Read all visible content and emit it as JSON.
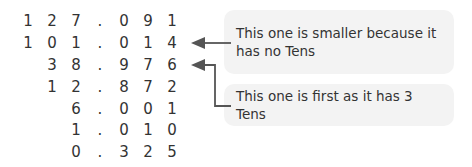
{
  "rows": [
    {
      "digits": [
        "1",
        "2",
        "7",
        ".",
        "0",
        "9",
        "1"
      ],
      "value": "127.091"
    },
    {
      "digits": [
        "1",
        "0",
        "1",
        ".",
        "0",
        "1",
        "4"
      ],
      "value": "101.014"
    },
    {
      "digits": [
        "",
        "3",
        "8",
        ".",
        "9",
        "7",
        "6"
      ],
      "value": "38.976"
    },
    {
      "digits": [
        "",
        "1",
        "2",
        ".",
        "8",
        "7",
        "2"
      ],
      "value": "12.872"
    },
    {
      "digits": [
        "",
        "",
        "6",
        ".",
        "0",
        "0",
        "1"
      ],
      "value": "6.001"
    },
    {
      "digits": [
        "",
        "",
        "1",
        ".",
        "0",
        "1",
        "0"
      ],
      "value": "1.010"
    },
    {
      "digits": [
        "",
        "",
        "0",
        ".",
        "3",
        "2",
        "5"
      ],
      "value": "0.325"
    }
  ],
  "callouts": {
    "smaller": "This one is smaller because it has no Tens",
    "first": "This one is first as it has 3 Tens"
  },
  "colors": {
    "arrow": "#555555",
    "callout_bg": "#f3f3f3",
    "text": "#333333"
  }
}
